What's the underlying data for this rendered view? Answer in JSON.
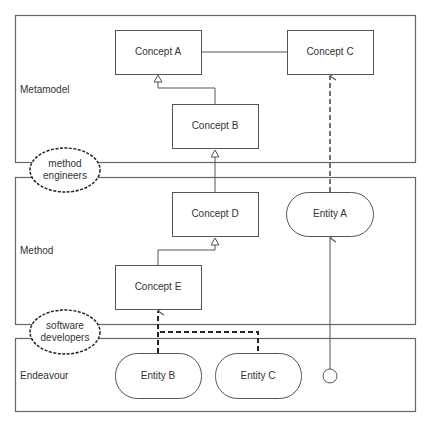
{
  "layers": [
    {
      "id": "metamodel",
      "label": "Metamodel"
    },
    {
      "id": "method",
      "label": "Method"
    },
    {
      "id": "endeavour",
      "label": "Endeavour"
    }
  ],
  "actors": [
    {
      "id": "method-engineers",
      "line1": "method",
      "line2": "engineers"
    },
    {
      "id": "software-developers",
      "line1": "software",
      "line2": "developers"
    }
  ],
  "concepts": [
    {
      "id": "concept-a",
      "label": "Concept A"
    },
    {
      "id": "concept-b",
      "label": "Concept B"
    },
    {
      "id": "concept-c",
      "label": "Concept C"
    },
    {
      "id": "concept-d",
      "label": "Concept D"
    },
    {
      "id": "concept-e",
      "label": "Concept E"
    }
  ],
  "entities": [
    {
      "id": "entity-a",
      "label": "Entity A"
    },
    {
      "id": "entity-b",
      "label": "Entity B"
    },
    {
      "id": "entity-c",
      "label": "Entity C"
    }
  ],
  "relations": [
    {
      "from": "Concept B",
      "to": "Concept A",
      "type": "generalization"
    },
    {
      "from": "Concept D",
      "to": "Concept B",
      "type": "generalization"
    },
    {
      "from": "Concept E",
      "to": "Concept D",
      "type": "generalization"
    },
    {
      "from": "Concept A",
      "to": "Concept C",
      "type": "association"
    },
    {
      "from": "Entity A",
      "to": "Concept C",
      "type": "instance-of (dashed)"
    },
    {
      "from": "Entity B",
      "to": "Concept E",
      "type": "instance-of (dashed)"
    },
    {
      "from": "Entity C",
      "to": "Concept E",
      "type": "instance-of (dashed)"
    },
    {
      "from": "endeavour-node",
      "to": "Entity A",
      "type": "directed association"
    }
  ],
  "colors": {
    "stroke": "#555555",
    "text": "#333333",
    "background": "#ffffff"
  }
}
